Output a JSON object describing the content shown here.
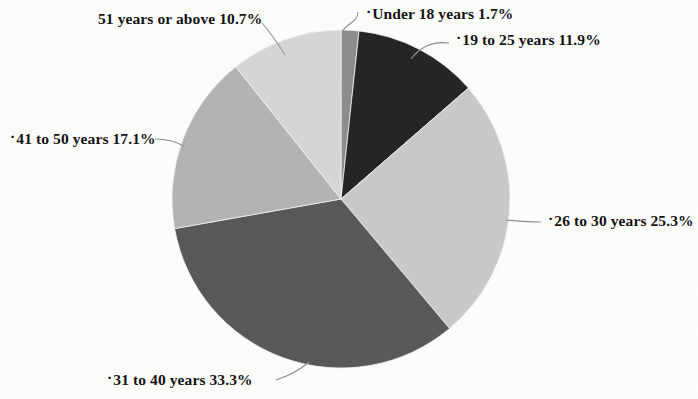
{
  "chart_data": {
    "type": "pie",
    "title": "",
    "subtitle": "",
    "xlabel": "",
    "ylabel": "",
    "legend_position": "none",
    "labels_position": "outside-with-leader-lines",
    "total_percent": 100.0,
    "unit": "%",
    "categories": [
      "Under 18 years",
      "19 to 25 years",
      "26 to 30 years",
      "31 to 40 years",
      "41 to 50 years",
      "51 years or above"
    ],
    "values": [
      1.7,
      11.9,
      25.3,
      33.3,
      17.1,
      10.7
    ],
    "colors": [
      "#8c8c8c",
      "#232323",
      "#c9c9c9",
      "#575757",
      "#b3b3b3",
      "#d6d6d6"
    ],
    "slices": [
      {
        "name": "Under 18 years",
        "value": 1.7,
        "value_text": "1.7%",
        "label_text": "Under 18 years 1.7%",
        "color": "#8c8c8c",
        "start_angle": 0,
        "end_angle": 6.12
      },
      {
        "name": "19 to 25 years",
        "value": 11.9,
        "value_text": "11.9%",
        "label_text": "19 to 25 years 11.9%",
        "color": "#232323",
        "start_angle": 6.12,
        "end_angle": 48.96
      },
      {
        "name": "26 to 30 years",
        "value": 25.3,
        "value_text": "25.3%",
        "label_text": "26 to 30 years 25.3%",
        "color": "#c9c9c9",
        "start_angle": 48.96,
        "end_angle": 140.04
      },
      {
        "name": "31 to 40 years",
        "value": 33.3,
        "value_text": "33.3%",
        "label_text": "31 to 40 years 33.3%",
        "color": "#575757",
        "start_angle": 140.04,
        "end_angle": 259.92
      },
      {
        "name": "41 to 50 years",
        "value": 17.1,
        "value_text": "17.1%",
        "label_text": "41 to 50 years 17.1%",
        "color": "#b3b3b3",
        "start_angle": 259.92,
        "end_angle": 321.48
      },
      {
        "name": "51 years or above",
        "value": 10.7,
        "value_text": "10.7%",
        "label_text": "51 years or above 10.7%",
        "color": "#d6d6d6",
        "start_angle": 321.48,
        "end_angle": 360
      }
    ]
  },
  "labels": {
    "under18": "Under 18 years 1.7%",
    "age19to25": "19 to 25 years 11.9%",
    "age26to30": "26 to 30 years 25.3%",
    "age31to40": "31 to 40 years 33.3%",
    "age41to50": "41 to 50 years 17.1%",
    "age51plus": "51 years or above 10.7%",
    "bullet": "·"
  }
}
